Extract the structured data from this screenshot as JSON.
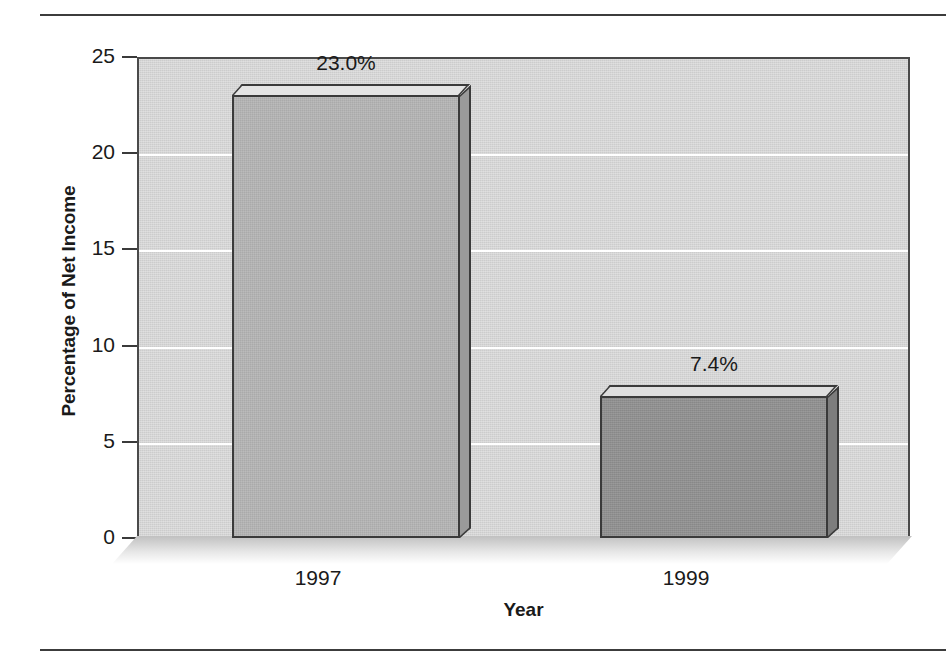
{
  "chart_data": {
    "type": "bar",
    "title": "",
    "xlabel": "Year",
    "ylabel": "Percentage of Net Income",
    "categories": [
      "1997",
      "1999"
    ],
    "values": [
      23.0,
      7.4
    ],
    "value_labels": [
      "23.0%",
      "7.4%"
    ],
    "ylim": [
      0,
      25
    ],
    "yticks": [
      0,
      5,
      10,
      15,
      20,
      25
    ],
    "ytick_labels": [
      "0",
      "5",
      "10",
      "15",
      "20",
      "25"
    ],
    "grid": true,
    "gridline_values": [
      5,
      10,
      15,
      20
    ],
    "legend": null,
    "style": "3d-bar",
    "series": [
      {
        "name": "Percentage of Net Income",
        "values": [
          23.0,
          7.4
        ]
      }
    ],
    "bar_colors": [
      "#b3b3b3",
      "#8f8f8f"
    ],
    "plot_background": "#cccccc",
    "gridline_color": "#ffffff",
    "axis_color": "#3a3a3a",
    "text_color": "#1a1a1a"
  },
  "axes": {
    "y_title": "Percentage of Net Income",
    "x_title": "Year",
    "y_ticks": [
      {
        "label": "25",
        "value": 25
      },
      {
        "label": "20",
        "value": 20
      },
      {
        "label": "15",
        "value": 15
      },
      {
        "label": "10",
        "value": 10
      },
      {
        "label": "5",
        "value": 5
      },
      {
        "label": "0",
        "value": 0
      }
    ],
    "x_ticks": [
      {
        "label": "1997"
      },
      {
        "label": "1999"
      }
    ]
  },
  "bars": [
    {
      "category": "1997",
      "value": 23.0,
      "value_label": "23.0%",
      "fill": "#b3b3b3",
      "top_fill": "#e4e4e4",
      "side_fill": "#9a9a9a"
    },
    {
      "category": "1999",
      "value": 7.4,
      "value_label": "7.4%",
      "fill": "#8f8f8f",
      "top_fill": "#dedede",
      "side_fill": "#7d7d7d"
    }
  ]
}
